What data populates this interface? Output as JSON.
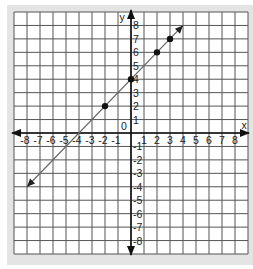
{
  "chart_data": {
    "type": "line",
    "title": "",
    "xlabel": "x",
    "ylabel": "y",
    "xlim": [
      -9,
      9
    ],
    "ylim": [
      -9,
      9
    ],
    "grid": true,
    "origin_label": "0",
    "x_ticks": [
      -8,
      -7,
      -6,
      -5,
      -4,
      -3,
      -2,
      -1,
      1,
      2,
      3,
      4,
      5,
      6,
      7,
      8
    ],
    "y_ticks": [
      -8,
      -7,
      -6,
      -5,
      -4,
      -3,
      -2,
      -1,
      1,
      2,
      3,
      4,
      5,
      6,
      7,
      8
    ],
    "series": [
      {
        "name": "y = x + 4",
        "line": {
          "from": [
            -8,
            -4
          ],
          "to": [
            4,
            8
          ],
          "arrows": "both"
        },
        "points": [
          [
            -2,
            2
          ],
          [
            0,
            4
          ],
          [
            2,
            6
          ],
          [
            3,
            7
          ]
        ]
      }
    ]
  },
  "colors": {
    "frame": "#e4e4e4",
    "grid": "#555555",
    "line": "#666666",
    "points": "#111111"
  }
}
